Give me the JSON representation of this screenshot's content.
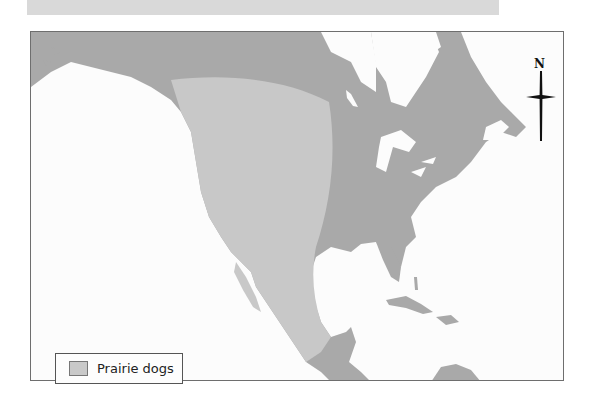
{
  "map": {
    "type": "range-map",
    "region": "North America",
    "colors": {
      "ocean": "#fcfcfc",
      "land": "#a9a9a9",
      "range": "#c8c8c8",
      "border": "#6e6e6e"
    }
  },
  "compass": {
    "label": "N"
  },
  "legend": {
    "items": [
      {
        "label": "Prairie dogs",
        "color": "#c9c9c9"
      }
    ]
  }
}
